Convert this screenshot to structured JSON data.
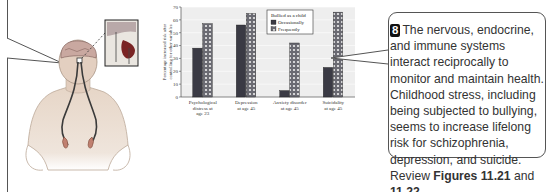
{
  "callout": {
    "badge": "8",
    "text_parts": [
      "The nervous, endocrine, and immune systems interact reciprocally to monitor and maintain health. Childhood stress, including being subjected to bullying, seems to increase lifelong risk for schizophrenia, depression, and suicide. Review ",
      "Figures 11.21",
      " and ",
      "11.22"
    ]
  },
  "chart_data": {
    "type": "bar",
    "title": "",
    "xlabel": "",
    "ylabel": "Percentage increased risk after controlling for other variables",
    "ylim": [
      0,
      70
    ],
    "yticks": [
      "0",
      "10",
      "20",
      "30",
      "40",
      "50",
      "60",
      "70"
    ],
    "categories": [
      "Psychological distress at age 23",
      "Depression at age 45",
      "Anxiety disorder at age 45",
      "Suicidality at age 45"
    ],
    "category_lines": [
      [
        "Psychological",
        "distress at",
        "age 23"
      ],
      [
        "Depression",
        "at age 45"
      ],
      [
        "Anxiety disorder",
        "at age 45"
      ],
      [
        "Suicidality",
        "at age 45"
      ]
    ],
    "legend_title": "Bullied as a child",
    "legend_position": "upper-center-right",
    "grid": true,
    "series": [
      {
        "name": "Occasionally",
        "values": [
          38,
          56,
          5,
          23
        ],
        "color": "#3a3a44"
      },
      {
        "name": "Frequently",
        "values": [
          57,
          65,
          42,
          66
        ],
        "color": "#6a6a72",
        "pattern": "dots"
      }
    ]
  }
}
